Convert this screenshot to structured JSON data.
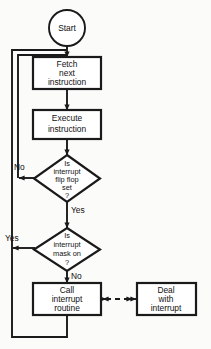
{
  "diagram": {
    "background_color": "#fbfbf9",
    "line_color": "#1a1a1a",
    "node_fill": "#ffffff",
    "nodes": {
      "start": {
        "type": "terminator-oval",
        "label": "Start"
      },
      "fetch": {
        "type": "process-box",
        "line1": "Fetch",
        "line2": "next",
        "line3": "instruction"
      },
      "execute": {
        "type": "process-box",
        "line1": "Execute",
        "line2": "instruction"
      },
      "decision_flipflop": {
        "type": "decision-diamond",
        "line1": "Is",
        "line2": "interrupt",
        "line3": "flip flop",
        "line4": "set",
        "line5": "?"
      },
      "decision_mask": {
        "type": "decision-diamond",
        "line1": "Is",
        "line2": "interrupt",
        "line3": "mask on",
        "line4": "?"
      },
      "call_routine": {
        "type": "process-box",
        "line1": "Call",
        "line2": "interrupt",
        "line3": "routine"
      },
      "deal_interrupt": {
        "type": "process-box",
        "line1": "Deal",
        "line2": "with",
        "line3": "interrupt"
      }
    },
    "edge_labels": {
      "flipflop_no": "No",
      "flipflop_yes": "Yes",
      "mask_yes": "Yes",
      "mask_no": "No"
    }
  }
}
